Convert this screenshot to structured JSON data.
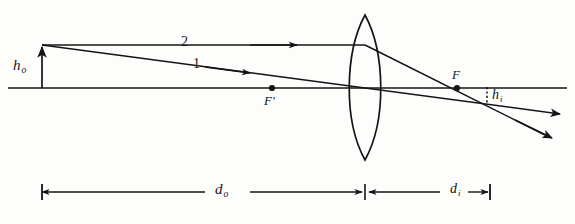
{
  "figure": {
    "kind": "thin-lens-ray-diagram",
    "ink_color": "#141414",
    "background_color": "#fdfdfc"
  },
  "labels": {
    "object_height": {
      "base": "h",
      "sub": "o",
      "name": "h_o"
    },
    "image_height": {
      "base": "h",
      "sub": "i",
      "name": "h_i"
    },
    "near_focal_point": "F'",
    "far_focal_point": "F",
    "object_distance": {
      "base": "d",
      "sub": "o",
      "name": "d_o"
    },
    "image_distance": {
      "base": "d",
      "sub": "i",
      "name": "d_i"
    },
    "ray_one": "1",
    "ray_two": "2"
  },
  "geometry": {
    "optical_axis": {
      "y": 88,
      "x_start": 8,
      "x_end": 567
    },
    "lens": {
      "center_x": 365,
      "top_y": 15,
      "bottom_y": 160,
      "half_width": 22
    },
    "object": {
      "x": 42,
      "tip_y": 45,
      "base_y": 88
    },
    "image": {
      "x": 487,
      "tip_y": 104,
      "base_y": 88
    },
    "focal_point_near": {
      "x": 272,
      "y": 88
    },
    "focal_point_far": {
      "x": 457,
      "y": 88
    },
    "ray_two_path": "horizontal from object tip to lens, then refracted through F to image tip and beyond",
    "ray_one_path": "from object tip through lens center, straight on to image tip and beyond",
    "dimension_bar_y": 192,
    "d_o_span": [
      42,
      363
    ],
    "d_i_span": [
      367,
      490
    ]
  }
}
